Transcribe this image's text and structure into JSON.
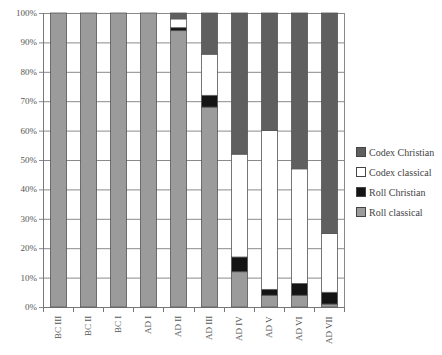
{
  "chart_data": {
    "type": "bar",
    "stacked": true,
    "percent": true,
    "title": "",
    "xlabel": "",
    "ylabel": "",
    "ylim": [
      0,
      100
    ],
    "yticks": [
      "0%",
      "10%",
      "20%",
      "30%",
      "40%",
      "50%",
      "60%",
      "70%",
      "80%",
      "90%",
      "100%"
    ],
    "categories": [
      "BC III",
      "BC II",
      "BC I",
      "AD I",
      "AD II",
      "AD III",
      "AD IV",
      "AD V",
      "AD VI",
      "AD VII"
    ],
    "series": [
      {
        "name": "Roll classical",
        "color": "#9b9b9b",
        "values": [
          100,
          100,
          100,
          100,
          94,
          68,
          12,
          4,
          4,
          1
        ]
      },
      {
        "name": "Roll Christian",
        "color": "#141414",
        "values": [
          0,
          0,
          0,
          0,
          1,
          4,
          5,
          2,
          4,
          4
        ]
      },
      {
        "name": "Codex classical",
        "color": "#ffffff",
        "values": [
          0,
          0,
          0,
          0,
          3,
          14,
          35,
          54,
          39,
          20
        ]
      },
      {
        "name": "Codex Christian",
        "color": "#5f5f5f",
        "values": [
          0,
          0,
          0,
          0,
          2,
          14,
          48,
          40,
          53,
          75
        ]
      }
    ],
    "legend": [
      "Codex Christian",
      "Codex classical",
      "Roll Christian",
      "Roll classical"
    ],
    "legend_position": "right",
    "grid": true
  }
}
